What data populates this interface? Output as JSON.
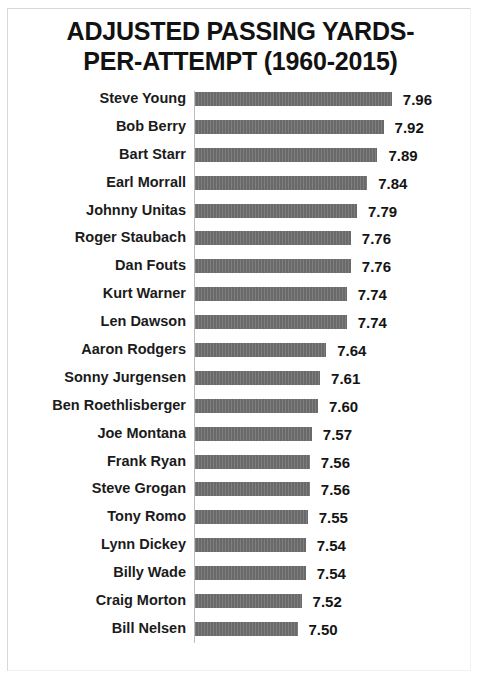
{
  "chart_data": {
    "type": "bar",
    "orientation": "horizontal",
    "title_lines": [
      "ADJUSTED PASSING YARDS-",
      "PER-ATTEMPT (1960-2015)"
    ],
    "xlabel": "",
    "ylabel": "",
    "xlim": [
      7.0,
      8.0
    ],
    "grid": false,
    "legend": null,
    "bar_color": "#6f6f6f",
    "text_color": "#141414",
    "categories": [
      "Steve Young",
      "Bob Berry",
      "Bart Starr",
      "Earl Morrall",
      "Johnny Unitas",
      "Roger Staubach",
      "Dan Fouts",
      "Kurt Warner",
      "Len Dawson",
      "Aaron Rodgers",
      "Sonny Jurgensen",
      "Ben Roethlisberger",
      "Joe Montana",
      "Frank Ryan",
      "Steve Grogan",
      "Tony Romo",
      "Lynn Dickey",
      "Billy Wade",
      "Craig Morton",
      "Bill Nelsen"
    ],
    "values": [
      7.96,
      7.92,
      7.89,
      7.84,
      7.79,
      7.76,
      7.76,
      7.74,
      7.74,
      7.64,
      7.61,
      7.6,
      7.57,
      7.56,
      7.56,
      7.55,
      7.54,
      7.54,
      7.52,
      7.5
    ],
    "value_labels": [
      "7.96",
      "7.92",
      "7.89",
      "7.84",
      "7.79",
      "7.76",
      "7.76",
      "7.74",
      "7.74",
      "7.64",
      "7.61",
      "7.60",
      "7.57",
      "7.56",
      "7.56",
      "7.55",
      "7.54",
      "7.54",
      "7.52",
      "7.50"
    ]
  }
}
